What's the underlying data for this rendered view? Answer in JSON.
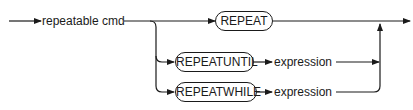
{
  "diagram": {
    "type": "syntax-railroad",
    "entry": {
      "label": "repeatable cmd"
    },
    "branches": [
      {
        "terminal": "REPEAT",
        "nonterminal": null
      },
      {
        "terminal": "REPEATUNTIL",
        "nonterminal": "expression"
      },
      {
        "terminal": "REPEATWHILE",
        "nonterminal": "expression"
      }
    ]
  }
}
